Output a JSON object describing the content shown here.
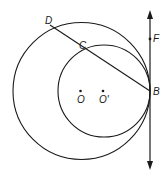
{
  "diagram": {
    "type": "geometry",
    "colors": {
      "stroke": "#1a1a1a",
      "background": "#ffffff"
    },
    "circles": [
      {
        "name": "large-circle",
        "center_label": "O",
        "cx": 81.5,
        "cy": 91,
        "r": 68.5
      },
      {
        "name": "small-circle",
        "center_label": "O'",
        "cx": 104,
        "cy": 91,
        "r": 46
      }
    ],
    "points": {
      "D": {
        "label": "D",
        "x": 50,
        "y": 25
      },
      "C": {
        "label": "C",
        "x": 83.5,
        "y": 51.5
      },
      "B": {
        "label": "B",
        "x": 150,
        "y": 91
      },
      "F": {
        "label": "F",
        "x": 150,
        "y": 39
      },
      "O": {
        "label": "O",
        "x": 80.5,
        "y": 91
      },
      "O_prime": {
        "label": "O'",
        "x": 103,
        "y": 91
      }
    },
    "segments": [
      {
        "name": "chord-DB",
        "from": "D",
        "to": "B"
      }
    ],
    "tangent_line": {
      "x": 150,
      "y_top": 12,
      "y_bottom": 168,
      "arrows": "both"
    }
  }
}
